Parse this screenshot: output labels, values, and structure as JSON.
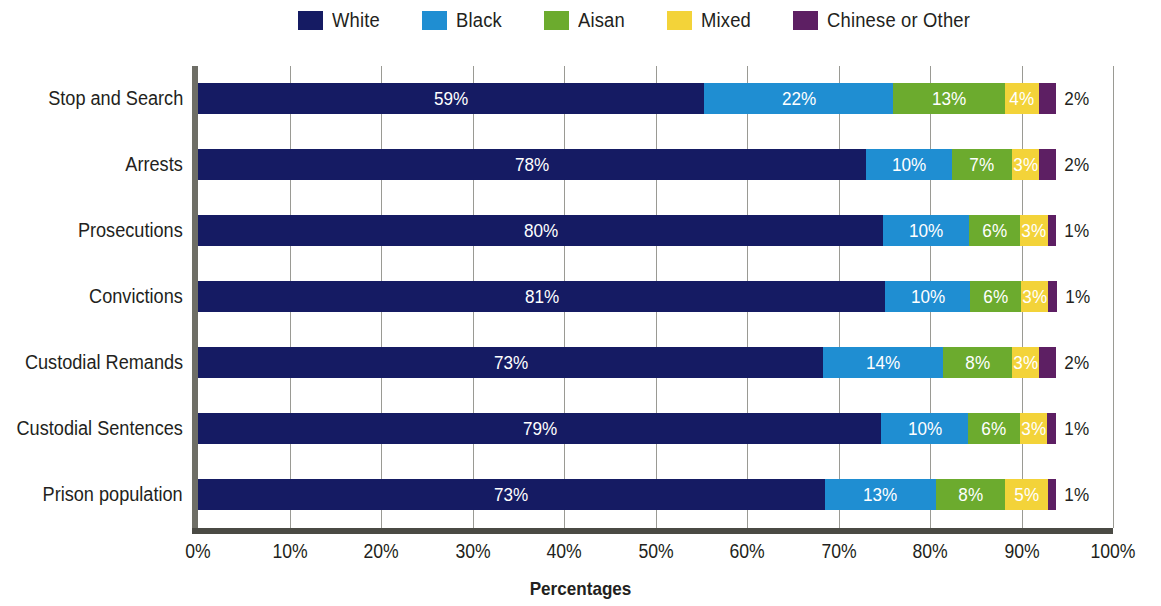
{
  "legend": {
    "items": [
      {
        "label": "White",
        "color": "#151b63",
        "icon": "legend-swatch-white"
      },
      {
        "label": "Black",
        "color": "#1f8ed2",
        "icon": "legend-swatch-black"
      },
      {
        "label": "Aisan",
        "color": "#6cab2e",
        "icon": "legend-swatch-asian"
      },
      {
        "label": "Mixed",
        "color": "#f3d339",
        "icon": "legend-swatch-mixed"
      },
      {
        "label": "Chinese or Other",
        "color": "#5d1f63",
        "icon": "legend-swatch-chinese-or-other"
      }
    ]
  },
  "axis": {
    "x_title": "Percentages",
    "x_ticks": [
      "0%",
      "10%",
      "20%",
      "30%",
      "40%",
      "50%",
      "60%",
      "70%",
      "80%",
      "90%",
      "100%"
    ]
  },
  "chart_data": {
    "type": "bar",
    "orientation": "horizontal",
    "stacked": true,
    "title": "",
    "subtitle": "",
    "xlabel": "Percentages",
    "ylabel": "",
    "xlim": [
      0,
      100
    ],
    "xticks": [
      0,
      10,
      20,
      30,
      40,
      50,
      60,
      70,
      80,
      90,
      100
    ],
    "xtick_labels": [
      "0%",
      "10%",
      "20%",
      "30%",
      "40%",
      "50%",
      "60%",
      "70%",
      "80%",
      "90%",
      "100%"
    ],
    "grid": "vertical",
    "legend_position": "top",
    "value_suffix": "%",
    "categories": [
      "Stop and Search",
      "Arrests",
      "Prosecutions",
      "Convictions",
      "Custodial Remands",
      "Custodial Sentences",
      "Prison population"
    ],
    "series": [
      {
        "name": "White",
        "color": "#151b63",
        "values": [
          59,
          78,
          80,
          81,
          73,
          79,
          73
        ]
      },
      {
        "name": "Black",
        "color": "#1f8ed2",
        "values": [
          22,
          10,
          10,
          10,
          14,
          10,
          13
        ]
      },
      {
        "name": "Aisan",
        "color": "#6cab2e",
        "values": [
          13,
          7,
          6,
          6,
          8,
          6,
          8
        ]
      },
      {
        "name": "Mixed",
        "color": "#f3d339",
        "values": [
          4,
          3,
          3,
          3,
          3,
          3,
          5
        ]
      },
      {
        "name": "Chinese or Other",
        "color": "#5d1f63",
        "values": [
          2,
          2,
          1,
          1,
          2,
          1,
          1
        ]
      }
    ],
    "data_labels": [
      {
        "category": "Stop and Search",
        "labels": [
          "59%",
          "22%",
          "13%",
          "4%",
          "2%"
        ]
      },
      {
        "category": "Arrests",
        "labels": [
          "78%",
          "10%",
          "7%",
          "3%",
          "2%"
        ]
      },
      {
        "category": "Prosecutions",
        "labels": [
          "80%",
          "10%",
          "6%",
          "3%",
          "1%"
        ]
      },
      {
        "category": "Convictions",
        "labels": [
          "81%",
          "10%",
          "6%",
          "3%",
          "1%"
        ]
      },
      {
        "category": "Custodial Remands",
        "labels": [
          "73%",
          "14%",
          "8%",
          "3%",
          "2%"
        ]
      },
      {
        "category": "Custodial Sentences",
        "labels": [
          "79%",
          "10%",
          "6%",
          "3%",
          "1%"
        ]
      },
      {
        "category": "Prison population",
        "labels": [
          "73%",
          "13%",
          "8%",
          "5%",
          "1%"
        ]
      }
    ]
  }
}
